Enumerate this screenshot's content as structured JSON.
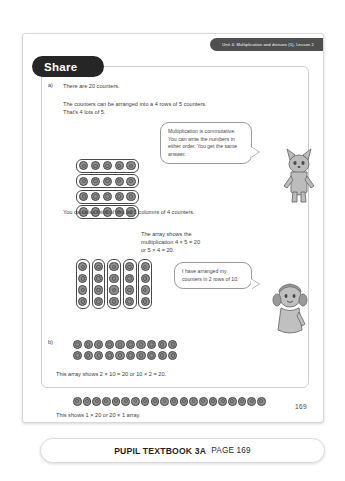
{
  "banner": {
    "unit_label": "Unit 4: Multiplication and division (1), Lesson 2"
  },
  "section": {
    "title": "Share"
  },
  "part_a": {
    "marker": "a)",
    "line_1": "There are 20 counters.",
    "line_2": "The counters can be arranged into a 4 rows of 5 counters.",
    "line_3": "That's 4 lots of 5.",
    "line_4": "You can also think of this as 5 columns of 4 counters.",
    "array_note_line_1": "The array shows the",
    "array_note_line_2": "multiplication 4 × 5 = 20",
    "array_note_line_3": "or 5 × 4 = 20.",
    "array_rows": 4,
    "array_cols": 5
  },
  "part_b": {
    "marker": "b)",
    "array_rows": 2,
    "array_cols": 10,
    "caption": "This array shows 2 × 10 = 20 or 10 × 2 = 20.",
    "single_row_count": 20,
    "single_row_caption": "This shows 1 × 20 or 20 × 1 array."
  },
  "bubbles": [
    {
      "id": "bubble-commutative",
      "text": "Multiplication is commutative. You can write the numbers in either order. You get the same answer."
    },
    {
      "id": "bubble-arranged",
      "text": "I have arranged my counters in 2 rows of 10."
    }
  ],
  "characters": [
    {
      "name": "fox-character"
    },
    {
      "name": "girl-character"
    }
  ],
  "page_number": "169",
  "caption_bar": {
    "book_label": "PUPIL TEXTBOOK 3A",
    "page_label": "PAGE 169"
  },
  "colors": {
    "banner_dark": "#4f4f4f",
    "pill_dark": "#262626",
    "counter_fill": "#8d8d8d",
    "counter_stroke": "#4a4a4a",
    "frame_border": "#cfcfcf",
    "text": "#3d3d3d"
  }
}
